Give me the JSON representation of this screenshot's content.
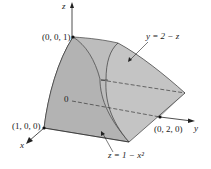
{
  "diagram": {
    "type": "3d-solid-region",
    "axes": {
      "x": "x",
      "y": "y",
      "z": "z"
    },
    "origin_label": "0",
    "points": [
      {
        "label": "(0, 0, 1)"
      },
      {
        "label": "(1, 0, 0)"
      },
      {
        "label": "(0, 2, 0)"
      }
    ],
    "surfaces": [
      {
        "label": "y = 2 − z"
      },
      {
        "label": "z = 1 − x²"
      }
    ],
    "colors": {
      "solid_fill": "#b9b9b9",
      "solid_dark": "#a6a6a6",
      "lines": "#222222"
    }
  }
}
